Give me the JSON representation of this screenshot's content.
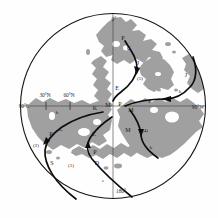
{
  "figure": {
    "kind": "polar map with trajectory tracks",
    "land_color": "#a0a0a0",
    "track_color": "#0d0d0d",
    "background_color": "#fefefe"
  },
  "graticule": {
    "top_label": "0°",
    "bottom_label": "180°",
    "left_label": "90°E",
    "right_label": "90°W",
    "ticks": [
      {
        "label": "30°N"
      },
      {
        "label": "60°N"
      }
    ]
  },
  "track_labels": [
    {
      "text": "P"
    },
    {
      "text": "C"
    },
    {
      "text": "J"
    },
    {
      "text": "(5)"
    },
    {
      "text": "E"
    },
    {
      "text": "M"
    },
    {
      "text": "K"
    },
    {
      "text": "P"
    },
    {
      "text": "M"
    },
    {
      "text": "F"
    },
    {
      "text": "J"
    },
    {
      "text": "k"
    },
    {
      "text": "M"
    },
    {
      "text": "(4)"
    },
    {
      "text": "k"
    },
    {
      "text": "b"
    },
    {
      "text": "C"
    },
    {
      "text": "P"
    },
    {
      "text": "(2)"
    },
    {
      "text": "S"
    },
    {
      "text": "E"
    },
    {
      "text": "P"
    },
    {
      "text": "(1)"
    },
    {
      "text": "D"
    },
    {
      "text": "e"
    }
  ]
}
